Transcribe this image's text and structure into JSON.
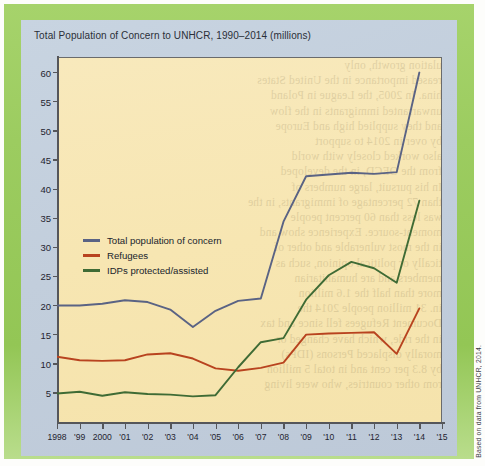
{
  "figure": {
    "title": "Total Population of Concern to UNHCR, 1990–2014 (millions)",
    "source_note": "Based on data from UNHCR, 2014.",
    "frame_color": "#9ccc60",
    "panel_color": "#c3cfdd",
    "plot_color": "#f7e6b4"
  },
  "legend": {
    "position": "inside-left",
    "items": [
      {
        "label": "Total population of concern",
        "color": "#5a6384"
      },
      {
        "label": "Refugees",
        "color": "#b8431f"
      },
      {
        "label": "IDPs protected/assisted",
        "color": "#3f6b35"
      }
    ]
  },
  "chart_data": {
    "type": "line",
    "title": "Total Population of Concern to UNHCR, 1990–2014 (millions)",
    "xlabel": "",
    "ylabel": "",
    "ylim": [
      0,
      62
    ],
    "xlim": [
      1998,
      2015
    ],
    "grid": false,
    "y_ticks": [
      5,
      10,
      15,
      20,
      25,
      30,
      35,
      40,
      45,
      50,
      55,
      60
    ],
    "x_ticks": [
      1998,
      1999,
      2000,
      2001,
      2002,
      2003,
      2004,
      2005,
      2006,
      2007,
      2008,
      2009,
      2010,
      2011,
      2012,
      2013,
      2014,
      2015
    ],
    "x_tick_labels": [
      "1998",
      "'99",
      "2000",
      "'01",
      "'02",
      "'03",
      "'04",
      "'05",
      "'06",
      "'07",
      "'08",
      "'09",
      "'10",
      "'11",
      "'12",
      "'13",
      "'14",
      "'15"
    ],
    "x": [
      1998,
      1999,
      2000,
      2001,
      2002,
      2003,
      2004,
      2005,
      2006,
      2007,
      2008,
      2009,
      2010,
      2011,
      2012,
      2013,
      2014
    ],
    "series": [
      {
        "name": "Total population of concern",
        "color": "#5a6384",
        "values": [
          20.0,
          20.0,
          20.3,
          20.9,
          20.6,
          19.3,
          16.3,
          19.1,
          20.8,
          21.2,
          34.4,
          42.2,
          42.5,
          42.8,
          42.6,
          42.9,
          60.0
        ]
      },
      {
        "name": "Refugees",
        "color": "#b8431f",
        "values": [
          11.2,
          10.6,
          10.5,
          10.6,
          11.6,
          11.8,
          10.9,
          9.2,
          8.8,
          9.3,
          10.2,
          15.0,
          15.2,
          15.3,
          15.4,
          11.7,
          19.5
        ]
      },
      {
        "name": "IDPs protected/assisted",
        "color": "#3f6b35",
        "values": [
          4.9,
          5.2,
          4.5,
          5.1,
          4.8,
          4.7,
          4.4,
          4.6,
          9.4,
          13.7,
          14.4,
          21.0,
          25.2,
          27.5,
          26.4,
          23.9,
          38.0
        ]
      }
    ]
  },
  "background_text": {
    "lines": [
      "ulation growth, only",
      "reased importance in the United States",
      "hina. In 2005, the League in Poland",
      "unwarranted immigrants in the flow",
      "and they supplied high and Europe",
      "by over in 2014 to support",
      "also worked closely with world",
      "from the OECD, in the developed",
      "In his pursuit, large numbers of",
      "than 72 percentage of immigrants, in the",
      "was less than 60 percent people",
      "moment-source. Experience show and",
      "in the most vulnerable and other of",
      "tically or political opinion, such as",
      "members and are humanitarian",
      "more than half the 1.6 million",
      "in. 31 million people 2014 the",
      "Document Refugees fell since and tax",
      "in the ride, which have changed or",
      "morally displaced Persons (IDPs)",
      "by 8.3 per cent and in total 5 million",
      "rom other countries, who were living"
    ]
  }
}
